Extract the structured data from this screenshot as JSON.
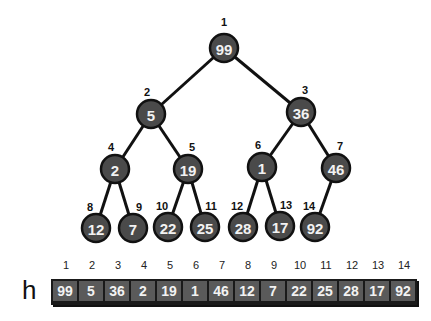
{
  "array_label": "h",
  "nodes": [
    {
      "i": 1,
      "v": 99,
      "x": 224,
      "y": 48
    },
    {
      "i": 2,
      "v": 5,
      "x": 151,
      "y": 114
    },
    {
      "i": 3,
      "v": 36,
      "x": 301,
      "y": 112
    },
    {
      "i": 4,
      "v": 2,
      "x": 115,
      "y": 169
    },
    {
      "i": 5,
      "v": 19,
      "x": 188,
      "y": 169
    },
    {
      "i": 6,
      "v": 1,
      "x": 262,
      "y": 167
    },
    {
      "i": 7,
      "v": 46,
      "x": 336,
      "y": 168
    },
    {
      "i": 8,
      "v": 12,
      "x": 96,
      "y": 228
    },
    {
      "i": 9,
      "v": 7,
      "x": 133,
      "y": 228
    },
    {
      "i": 10,
      "v": 22,
      "x": 168,
      "y": 227
    },
    {
      "i": 11,
      "v": 25,
      "x": 205,
      "y": 227
    },
    {
      "i": 12,
      "v": 28,
      "x": 243,
      "y": 227
    },
    {
      "i": 13,
      "v": 17,
      "x": 280,
      "y": 226
    },
    {
      "i": 14,
      "v": 92,
      "x": 315,
      "y": 227
    }
  ],
  "array": {
    "indices": [
      "1",
      "2",
      "3",
      "4",
      "5",
      "6",
      "7",
      "8",
      "9",
      "10",
      "11",
      "12",
      "13",
      "14"
    ],
    "values": [
      "99",
      "5",
      "36",
      "2",
      "19",
      "1",
      "46",
      "12",
      "7",
      "22",
      "25",
      "28",
      "17",
      "92"
    ]
  }
}
